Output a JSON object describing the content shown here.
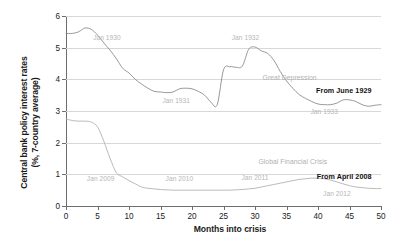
{
  "chart_data": {
    "type": "line",
    "title": "",
    "xlabel": "Months into crisis",
    "ylabel": "Central bank policy interest rates (%, 7-country average)",
    "ylabel_line1": "Central bank policy interest rates",
    "ylabel_line2": "(%, 7-country average)",
    "xlim": [
      0,
      50
    ],
    "ylim": [
      0,
      6
    ],
    "xticks": [
      0,
      5,
      10,
      15,
      20,
      25,
      30,
      35,
      40,
      45,
      50
    ],
    "yticks": [
      0,
      1,
      2,
      3,
      4,
      5,
      6
    ],
    "xtick_labels": [
      "0",
      "5",
      "10",
      "15",
      "20",
      "25",
      "30",
      "35",
      "40",
      "45",
      "50"
    ],
    "ytick_labels": [
      "0",
      "1",
      "2",
      "3",
      "4",
      "5",
      "6"
    ],
    "grid": "horizontal",
    "legend": "inline-end-labels",
    "series": [
      {
        "name": "From June 1929",
        "era_label": "Great Depression",
        "color": "#8c8c8c",
        "x": [
          0,
          1,
          2,
          3,
          4,
          5,
          6,
          7,
          8,
          9,
          10,
          11,
          12,
          13,
          14,
          15,
          16,
          17,
          18,
          19,
          20,
          21,
          22,
          23,
          24,
          25,
          26,
          27,
          28,
          29,
          30,
          31,
          32,
          33,
          34,
          35,
          36,
          37,
          38,
          39,
          40,
          41,
          42,
          43,
          44,
          45,
          46,
          47,
          48,
          49,
          50
        ],
        "values": [
          5.45,
          5.45,
          5.5,
          5.62,
          5.58,
          5.4,
          5.15,
          4.92,
          4.65,
          4.35,
          4.2,
          4.0,
          3.85,
          3.72,
          3.62,
          3.6,
          3.58,
          3.6,
          3.7,
          3.72,
          3.7,
          3.62,
          3.5,
          3.28,
          3.2,
          4.3,
          4.4,
          4.38,
          4.42,
          4.95,
          5.02,
          4.9,
          4.82,
          4.6,
          4.25,
          3.95,
          3.72,
          3.52,
          3.4,
          3.3,
          3.22,
          3.2,
          3.2,
          3.25,
          3.35,
          3.35,
          3.3,
          3.2,
          3.15,
          3.18,
          3.2
        ]
      },
      {
        "name": "From April 2008",
        "era_label": "Global Financial Crisis",
        "color": "#b2b2b2",
        "x": [
          0,
          1,
          2,
          3,
          4,
          5,
          6,
          7,
          8,
          9,
          10,
          11,
          12,
          13,
          14,
          15,
          16,
          17,
          18,
          19,
          20,
          21,
          22,
          23,
          24,
          25,
          26,
          27,
          28,
          29,
          30,
          31,
          32,
          33,
          34,
          35,
          36,
          37,
          38,
          39,
          40,
          41,
          42,
          43,
          44,
          45,
          46,
          47,
          48,
          49,
          50
        ],
        "values": [
          2.75,
          2.7,
          2.68,
          2.68,
          2.65,
          2.5,
          2.05,
          1.5,
          1.05,
          0.92,
          0.8,
          0.7,
          0.6,
          0.56,
          0.54,
          0.52,
          0.51,
          0.5,
          0.5,
          0.5,
          0.5,
          0.5,
          0.5,
          0.5,
          0.5,
          0.5,
          0.5,
          0.51,
          0.52,
          0.54,
          0.56,
          0.6,
          0.64,
          0.68,
          0.72,
          0.76,
          0.8,
          0.84,
          0.86,
          0.88,
          0.88,
          0.86,
          0.82,
          0.76,
          0.7,
          0.64,
          0.6,
          0.58,
          0.56,
          0.55,
          0.55
        ]
      }
    ],
    "annotations": [
      {
        "text": "Jan 1930",
        "x": 6.5,
        "y": 5.35,
        "series": "From June 1929",
        "style": "date"
      },
      {
        "text": "Jan 1931",
        "x": 17.5,
        "y": 3.35,
        "series": "From June 1929",
        "style": "date"
      },
      {
        "text": "Jan 1932",
        "x": 28.5,
        "y": 5.35,
        "series": "From June 1929",
        "style": "date"
      },
      {
        "text": "Jan 1933",
        "x": 41.0,
        "y": 3.0,
        "series": "From June 1929",
        "style": "date"
      },
      {
        "text": "Great Depression",
        "x": 35.5,
        "y": 4.08,
        "series": "From June 1929",
        "style": "era"
      },
      {
        "text": "From June 1929",
        "x": 48.5,
        "y": 3.65,
        "series": "From June 1929",
        "style": "end"
      },
      {
        "text": "Jan 2009",
        "x": 5.5,
        "y": 0.88,
        "series": "From April 2008",
        "style": "date"
      },
      {
        "text": "Jan 2010",
        "x": 18.0,
        "y": 0.88,
        "series": "From April 2008",
        "style": "date"
      },
      {
        "text": "Jan 2011",
        "x": 30.0,
        "y": 0.92,
        "series": "From April 2008",
        "style": "date"
      },
      {
        "text": "Jan 2012",
        "x": 43.0,
        "y": 0.42,
        "series": "From April 2008",
        "style": "date"
      },
      {
        "text": "Global Financial Crisis",
        "x": 36.0,
        "y": 1.42,
        "series": "From April 2008",
        "style": "era"
      },
      {
        "text": "From April 2008",
        "x": 48.5,
        "y": 0.96,
        "series": "From April 2008",
        "style": "end"
      }
    ]
  }
}
